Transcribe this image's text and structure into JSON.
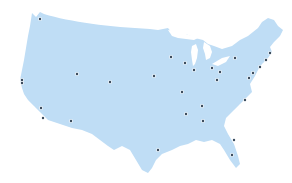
{
  "map": {
    "title": "United States",
    "land_color": "#BFDDF5",
    "lake_color": "#FFFFFF",
    "marker_color": "#3A4A5C",
    "marker_halo": "#FFFFFF",
    "marker_radius": 1.2,
    "markers": [
      {
        "x": 40,
        "y": 19
      },
      {
        "x": 22,
        "y": 80
      },
      {
        "x": 22,
        "y": 83
      },
      {
        "x": 41,
        "y": 108
      },
      {
        "x": 43,
        "y": 118
      },
      {
        "x": 71,
        "y": 121
      },
      {
        "x": 77,
        "y": 74
      },
      {
        "x": 110,
        "y": 82
      },
      {
        "x": 154,
        "y": 76
      },
      {
        "x": 171,
        "y": 57
      },
      {
        "x": 185,
        "y": 63
      },
      {
        "x": 194,
        "y": 70
      },
      {
        "x": 212,
        "y": 68
      },
      {
        "x": 220,
        "y": 72
      },
      {
        "x": 217,
        "y": 80
      },
      {
        "x": 235,
        "y": 58
      },
      {
        "x": 249,
        "y": 78
      },
      {
        "x": 253,
        "y": 73
      },
      {
        "x": 260,
        "y": 67
      },
      {
        "x": 266,
        "y": 60
      },
      {
        "x": 270,
        "y": 53
      },
      {
        "x": 182,
        "y": 92
      },
      {
        "x": 202,
        "y": 106
      },
      {
        "x": 186,
        "y": 114
      },
      {
        "x": 203,
        "y": 121
      },
      {
        "x": 245,
        "y": 100
      },
      {
        "x": 158,
        "y": 150
      },
      {
        "x": 234,
        "y": 140
      },
      {
        "x": 232,
        "y": 155
      }
    ]
  }
}
